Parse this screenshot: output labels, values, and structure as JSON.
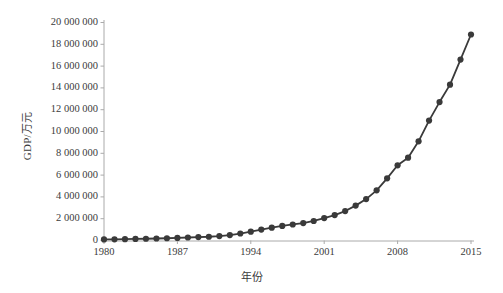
{
  "chart_data": {
    "type": "line",
    "title": "",
    "xlabel": "年份",
    "ylabel": "GDP/万元",
    "grid": false,
    "legend": false,
    "marker": "circle",
    "line_color": "#3a3a3a",
    "marker_color": "#3a3a3a",
    "axis_color": "#aaaaaa",
    "xlim": [
      1980,
      2015
    ],
    "ylim": [
      0,
      20000000
    ],
    "x_ticks": [
      1980,
      1987,
      1994,
      2001,
      2008,
      2015
    ],
    "x_tick_labels": [
      "1980",
      "1987",
      "1994",
      "2001",
      "2008",
      "2015"
    ],
    "y_ticks": [
      0,
      2000000,
      4000000,
      6000000,
      8000000,
      10000000,
      12000000,
      14000000,
      16000000,
      18000000,
      20000000
    ],
    "y_tick_labels": [
      "0",
      "2 000 000",
      "4 000 000",
      "6 000 000",
      "8 000 000",
      "10 000 000",
      "12 000 000",
      "14 000 000",
      "16 000 000",
      "18 000 000",
      "20 000 000"
    ],
    "x": [
      1980,
      1981,
      1982,
      1983,
      1984,
      1985,
      1986,
      1987,
      1988,
      1989,
      1990,
      1991,
      1992,
      1993,
      1994,
      1995,
      1996,
      1997,
      1998,
      1999,
      2000,
      2001,
      2002,
      2003,
      2004,
      2005,
      2006,
      2007,
      2008,
      2009,
      2010,
      2011,
      2012,
      2013,
      2014,
      2015
    ],
    "values": [
      95000,
      110000,
      125000,
      140000,
      160000,
      185000,
      205000,
      235000,
      275000,
      310000,
      345000,
      410000,
      500000,
      640000,
      810000,
      1000000,
      1180000,
      1340000,
      1470000,
      1600000,
      1790000,
      2060000,
      2330000,
      2700000,
      3200000,
      3800000,
      4600000,
      5700000,
      6900000,
      7600000,
      9100000,
      11000000,
      12700000,
      14300000,
      16600000,
      18900000
    ],
    "series_name": "GDP"
  }
}
